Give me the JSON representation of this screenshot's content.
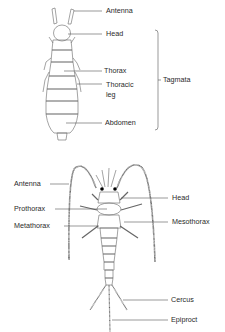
{
  "figure_top": {
    "labels": {
      "antenna": "Antenna",
      "head": "Head",
      "thorax": "Thorax",
      "thoracic_leg_line1": "Thoracic",
      "thoracic_leg_line2": "leg",
      "abdomen": "Abdomen",
      "tagmata": "Tagmata"
    }
  },
  "figure_bottom": {
    "labels": {
      "antenna": "Antenna",
      "head": "Head",
      "prothorax": "Prothorax",
      "mesothorax": "Mesothorax",
      "metathorax": "Metathorax",
      "cercus": "Cercus",
      "epiproct": "Epiproct"
    }
  },
  "colors": {
    "line": "#555555",
    "text": "#2a2a2a",
    "background": "#ffffff"
  }
}
